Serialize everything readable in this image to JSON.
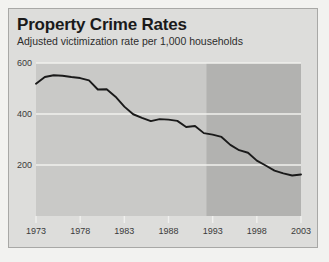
{
  "card": {
    "title": "Property Crime Rates",
    "subtitle": "Adjusted victimization rate per 1,000 households",
    "background_color": "#dddddb",
    "border_color": "#a8a8a6"
  },
  "chart_data": {
    "type": "line",
    "title": "Property Crime Rates",
    "subtitle": "Adjusted victimization rate per 1,000 households",
    "xlabel": "",
    "ylabel": "",
    "xlim": [
      1973,
      2003
    ],
    "ylim": [
      0,
      600
    ],
    "grid": true,
    "gridlines_y": [
      200,
      400,
      600
    ],
    "legend": "none",
    "plot_background_color": "#c9c9c7",
    "shaded_band_color": "#b2b2b0",
    "line_color": "#1a1a1a",
    "gridline_color": "#f0f0ee",
    "shaded_band": {
      "label": "",
      "x_start": 1992.3,
      "x_end": 2003
    },
    "y_ticks": [
      600,
      400,
      200
    ],
    "y_tick_labels": [
      "600",
      "400",
      "200"
    ],
    "x_ticks": [
      1973,
      1978,
      1983,
      1988,
      1993,
      1998,
      2003
    ],
    "x_tick_labels": [
      "1973",
      "1978",
      "1983",
      "1988",
      "1993",
      "1998",
      "2003"
    ],
    "x": [
      1973,
      1974,
      1975,
      1976,
      1977,
      1978,
      1979,
      1980,
      1981,
      1982,
      1983,
      1984,
      1985,
      1986,
      1987,
      1988,
      1989,
      1990,
      1991,
      1992,
      1993,
      1994,
      1995,
      1996,
      1997,
      1998,
      1999,
      2000,
      2001,
      2002,
      2003
    ],
    "values": [
      519,
      545,
      552,
      550,
      545,
      541,
      532,
      496,
      497,
      468,
      429,
      399,
      385,
      372,
      380,
      378,
      373,
      349,
      353,
      325,
      319,
      310,
      279,
      258,
      248,
      217,
      198,
      178,
      167,
      159,
      163
    ],
    "series": [
      {
        "name": "Adjusted victimization rate per 1,000 households",
        "values": [
          519,
          545,
          552,
          550,
          545,
          541,
          532,
          496,
          497,
          468,
          429,
          399,
          385,
          372,
          380,
          378,
          373,
          349,
          353,
          325,
          319,
          310,
          279,
          258,
          248,
          217,
          198,
          178,
          167,
          159,
          163
        ]
      }
    ]
  }
}
